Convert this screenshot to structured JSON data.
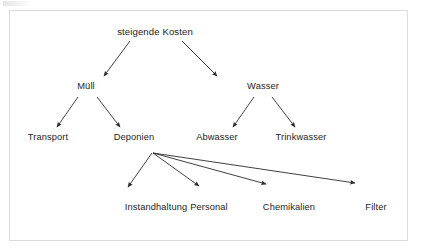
{
  "diagram": {
    "title": "steigende Kosten",
    "language": "de",
    "type": "tree-diagram",
    "colors": {
      "background": "#ffffff",
      "text": "#242424",
      "stroke": "#2b2b2b",
      "border": "#dcdcdc"
    },
    "nodes": [
      {
        "id": "kosten",
        "label": "steigende Kosten",
        "level": 0,
        "x": 155,
        "y": 31
      },
      {
        "id": "muell",
        "label": "Müll",
        "level": 1,
        "x": 86,
        "y": 86
      },
      {
        "id": "wasser",
        "label": "Wasser",
        "level": 1,
        "x": 263,
        "y": 86
      },
      {
        "id": "transport",
        "label": "Transport",
        "level": 2,
        "x": 48,
        "y": 137
      },
      {
        "id": "deponien",
        "label": "Deponien",
        "level": 2,
        "x": 134,
        "y": 137
      },
      {
        "id": "abwasser",
        "label": "Abwasser",
        "level": 2,
        "x": 217,
        "y": 137
      },
      {
        "id": "trinkwasser",
        "label": "Trinkwasser",
        "level": 2,
        "x": 301,
        "y": 137
      },
      {
        "id": "instandhaltung",
        "label": "Instandhaltung",
        "level": 3,
        "x": 156,
        "y": 207
      },
      {
        "id": "personal",
        "label": "Personal",
        "level": 3,
        "x": 209,
        "y": 207
      },
      {
        "id": "chemikalien",
        "label": "Chemikalien",
        "level": 3,
        "x": 289,
        "y": 207
      },
      {
        "id": "filter",
        "label": "Filter",
        "level": 3,
        "x": 376,
        "y": 207
      }
    ],
    "edges": [
      {
        "from": "kosten",
        "to": "muell",
        "x1": 130,
        "y1": 41,
        "x2": 104,
        "y2": 76
      },
      {
        "from": "kosten",
        "to": "wasser",
        "x1": 182,
        "y1": 41,
        "x2": 217,
        "y2": 76
      },
      {
        "from": "muell",
        "to": "transport",
        "x1": 78,
        "y1": 97,
        "x2": 57,
        "y2": 127
      },
      {
        "from": "muell",
        "to": "deponien",
        "x1": 97,
        "y1": 97,
        "x2": 120,
        "y2": 127
      },
      {
        "from": "wasser",
        "to": "abwasser",
        "x1": 254,
        "y1": 97,
        "x2": 233,
        "y2": 127
      },
      {
        "from": "wasser",
        "to": "trinkwasser",
        "x1": 272,
        "y1": 97,
        "x2": 295,
        "y2": 127
      },
      {
        "from": "deponien",
        "to": "instandhaltung",
        "x1": 152,
        "y1": 153,
        "x2": 128,
        "y2": 187
      },
      {
        "from": "deponien",
        "to": "personal",
        "x1": 153,
        "y1": 153,
        "x2": 199,
        "y2": 186
      },
      {
        "from": "deponien",
        "to": "chemikalien",
        "x1": 153,
        "y1": 153,
        "x2": 266,
        "y2": 184
      },
      {
        "from": "deponien",
        "to": "filter",
        "x1": 153,
        "y1": 153,
        "x2": 355,
        "y2": 183
      }
    ]
  }
}
